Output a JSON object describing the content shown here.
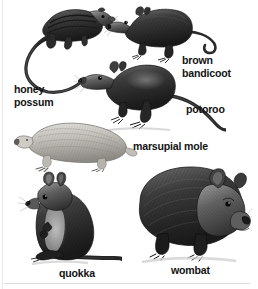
{
  "plate": {
    "title": "Australian marsupials illustration plate",
    "style": "grayscale pen-and-ink engraving",
    "background_color": "#ffffff",
    "ink_color": "#131313",
    "width": 258,
    "height": 289
  },
  "labels": [
    {
      "key": "honey_possum",
      "text": "honey\npossum",
      "line1": "honey",
      "line2": "possum",
      "x": 14,
      "y": 83
    },
    {
      "key": "brown_bandicoot",
      "text": "brown\nbandicoot",
      "line1": "brown",
      "line2": "bandicoot",
      "x": 182,
      "y": 54
    },
    {
      "key": "potoroo",
      "text": "potoroo",
      "line1": "potoroo",
      "line2": "",
      "x": 186,
      "y": 103
    },
    {
      "key": "marsupial_mole",
      "text": "marsupial mole",
      "line1": "marsupial mole",
      "line2": "",
      "x": 133,
      "y": 140
    },
    {
      "key": "quokka",
      "text": "quokka",
      "line1": "quokka",
      "line2": "",
      "x": 59,
      "y": 267
    },
    {
      "key": "wombat",
      "text": "wombat",
      "line1": "wombat",
      "line2": "",
      "x": 171,
      "y": 264
    }
  ],
  "figures": [
    {
      "key": "honey_possum",
      "name": "honey possum",
      "pose": "climbing, very long prehensile tail, striped back"
    },
    {
      "key": "brown_bandicoot",
      "name": "brown bandicoot",
      "pose": "standing in profile, long snout, long thin tail"
    },
    {
      "key": "potoroo",
      "name": "potoroo",
      "pose": "standing in profile, hopping hindfeet, long tail"
    },
    {
      "key": "marsupial_mole",
      "name": "marsupial mole",
      "pose": "crawling, pale silky fur, stout digging forelimbs"
    },
    {
      "key": "quokka",
      "name": "quokka",
      "pose": "sitting upright on hind legs, tail out behind"
    },
    {
      "key": "wombat",
      "name": "wombat",
      "pose": "standing stocky, broad head, short legs"
    }
  ]
}
